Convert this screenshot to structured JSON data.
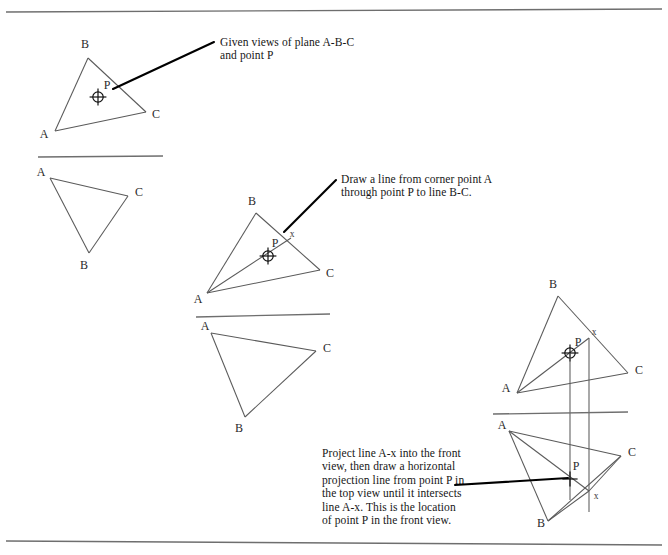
{
  "page": {
    "width": 668,
    "height": 555,
    "background": "#ffffff",
    "line_color": "#5a5a5a",
    "heavy_line_color": "#000000",
    "border_color": "#6e6e6e",
    "label_color": "#2b2b2b"
  },
  "borders": {
    "top": {
      "x1": 6,
      "y1": 12,
      "x2": 662,
      "y2": 9
    },
    "bottom": {
      "x1": 6,
      "y1": 541,
      "x2": 662,
      "y2": 545
    }
  },
  "annotations": [
    {
      "id": "annotation-given-views",
      "text": "Given views of plane A-B-C\nand point P",
      "x": 220,
      "y": 36,
      "leader": {
        "x1": 214,
        "y1": 42,
        "x2": 113,
        "y2": 89
      }
    },
    {
      "id": "annotation-draw-line",
      "text": "Draw a line from corner point A\nthrough point P to line B-C.",
      "x": 341,
      "y": 173,
      "leader": {
        "x1": 336,
        "y1": 180,
        "x2": 284,
        "y2": 232
      }
    },
    {
      "id": "annotation-project-line",
      "text": "Project line A-x into the front\nview, then draw a horizontal\nprojection line from point P in\nthe top view until it intersects\nline A-x. This is the location\nof point P in the front view.",
      "x": 322,
      "y": 447,
      "leader": {
        "x1": 455,
        "y1": 485,
        "x2": 568,
        "y2": 478
      }
    }
  ],
  "figures": [
    {
      "id": "figure-1",
      "name": "given-views",
      "fold_line": {
        "x1": 38,
        "y1": 157,
        "x2": 163,
        "y2": 156
      },
      "views": [
        {
          "id": "figure-1-top-view",
          "name": "top-view",
          "triangle": {
            "A": {
              "x": 55,
              "y": 131
            },
            "B": {
              "x": 88,
              "y": 58
            },
            "C": {
              "x": 146,
              "y": 112
            }
          },
          "labels": [
            {
              "text": "A",
              "x": 44,
              "y": 134
            },
            {
              "text": "B",
              "x": 85,
              "y": 44
            },
            {
              "text": "C",
              "x": 156,
              "y": 114
            },
            {
              "text": "P",
              "x": 107,
              "y": 85
            }
          ],
          "point_marker": {
            "type": "crosshair-circle",
            "x": 98,
            "y": 97,
            "r": 5.2
          }
        },
        {
          "id": "figure-1-front-view",
          "name": "front-view",
          "triangle": {
            "A": {
              "x": 50,
              "y": 178
            },
            "C": {
              "x": 128,
              "y": 196
            },
            "B": {
              "x": 89,
              "y": 253
            }
          },
          "labels": [
            {
              "text": "A",
              "x": 41,
              "y": 172
            },
            {
              "text": "C",
              "x": 139,
              "y": 192
            },
            {
              "text": "B",
              "x": 84,
              "y": 265
            }
          ]
        }
      ]
    },
    {
      "id": "figure-2",
      "name": "draw-line-a-x",
      "fold_line": {
        "x1": 196,
        "y1": 317,
        "x2": 330,
        "y2": 314
      },
      "views": [
        {
          "id": "figure-2-top-view",
          "name": "top-view",
          "triangle": {
            "A": {
              "x": 207,
              "y": 293
            },
            "B": {
              "x": 256,
              "y": 213
            },
            "C": {
              "x": 320,
              "y": 270
            }
          },
          "construction_lines": [
            {
              "name": "line-A-x",
              "x1": 207,
              "y1": 293,
              "x2": 291,
              "y2": 238
            }
          ],
          "labels": [
            {
              "text": "A",
              "x": 198,
              "y": 299
            },
            {
              "text": "B",
              "x": 252,
              "y": 201
            },
            {
              "text": "C",
              "x": 330,
              "y": 273
            },
            {
              "text": "P",
              "x": 275,
              "y": 243
            },
            {
              "text": "x",
              "x": 292,
              "y": 234,
              "small": true
            }
          ],
          "point_marker": {
            "type": "crosshair-circle",
            "x": 268,
            "y": 256,
            "r": 5.2
          }
        },
        {
          "id": "figure-2-front-view",
          "name": "front-view",
          "triangle": {
            "A": {
              "x": 211,
              "y": 333
            },
            "C": {
              "x": 316,
              "y": 351
            },
            "B": {
              "x": 245,
              "y": 417
            }
          },
          "labels": [
            {
              "text": "A",
              "x": 205,
              "y": 326
            },
            {
              "text": "C",
              "x": 327,
              "y": 348
            },
            {
              "text": "B",
              "x": 239,
              "y": 428
            }
          ]
        }
      ]
    },
    {
      "id": "figure-3",
      "name": "project-into-front-view",
      "fold_line": {
        "x1": 493,
        "y1": 414,
        "x2": 628,
        "y2": 412
      },
      "views": [
        {
          "id": "figure-3-top-view",
          "name": "top-view",
          "triangle": {
            "A": {
              "x": 517,
              "y": 393
            },
            "B": {
              "x": 558,
              "y": 296
            },
            "C": {
              "x": 628,
              "y": 373
            }
          },
          "construction_lines": [
            {
              "name": "line-A-x",
              "x1": 517,
              "y1": 393,
              "x2": 589,
              "y2": 338
            }
          ],
          "labels": [
            {
              "text": "A",
              "x": 506,
              "y": 388
            },
            {
              "text": "B",
              "x": 553,
              "y": 284
            },
            {
              "text": "C",
              "x": 639,
              "y": 370
            },
            {
              "text": "P",
              "x": 578,
              "y": 342
            },
            {
              "text": "x",
              "x": 594,
              "y": 332,
              "small": true
            }
          ],
          "point_marker": {
            "type": "crosshair-circle",
            "x": 570,
            "y": 353,
            "r": 5.2
          }
        },
        {
          "id": "figure-3-front-view",
          "name": "front-view",
          "triangle": {
            "A": {
              "x": 509,
              "y": 431
            },
            "C": {
              "x": 621,
              "y": 456
            },
            "B": {
              "x": 548,
              "y": 521
            }
          },
          "construction_lines": [
            {
              "name": "line-A-x-front",
              "x1": 509,
              "y1": 431,
              "x2": 589,
              "y2": 491
            },
            {
              "name": "line-B-x-front",
              "x1": 548,
              "y1": 521,
              "x2": 589,
              "y2": 491
            },
            {
              "name": "line-C-x-front",
              "x1": 621,
              "y1": 456,
              "x2": 589,
              "y2": 491
            }
          ],
          "projection_lines": [
            {
              "name": "projector-from-P",
              "x1": 570,
              "y1": 353,
              "x2": 570,
              "y2": 500
            },
            {
              "name": "projector-from-x",
              "x1": 589,
              "y1": 338,
              "x2": 589,
              "y2": 512
            }
          ],
          "labels": [
            {
              "text": "A",
              "x": 502,
              "y": 425
            },
            {
              "text": "C",
              "x": 632,
              "y": 452
            },
            {
              "text": "B",
              "x": 541,
              "y": 523
            },
            {
              "text": "P",
              "x": 576,
              "y": 466
            },
            {
              "text": "x",
              "x": 596,
              "y": 496,
              "small": true
            }
          ],
          "point_marker": {
            "type": "crosshair-plus",
            "x": 570,
            "y": 479,
            "r": 4.4
          }
        }
      ]
    }
  ]
}
